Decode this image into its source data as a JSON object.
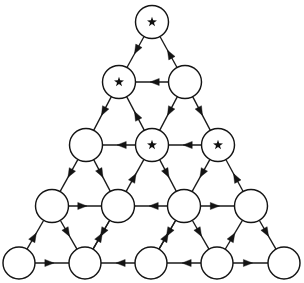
{
  "figure": {
    "background_color": "#ffffff",
    "line_color": "#141414",
    "node_fill_color": "#ffffff",
    "star_color": "#111111",
    "width": 304,
    "height": 283,
    "row_count": 5,
    "node_count": 15,
    "starred_node_count": 4,
    "marker_glyph": "star"
  },
  "nodes": [
    {
      "id": "r1c1",
      "row": 1,
      "col": 1,
      "cx": 152,
      "cy": 22,
      "r": 16.5,
      "star": true,
      "label": ""
    },
    {
      "id": "r2c1",
      "row": 2,
      "col": 1,
      "cx": 119,
      "cy": 82,
      "r": 16.5,
      "star": true,
      "label": ""
    },
    {
      "id": "r2c2",
      "row": 2,
      "col": 2,
      "cx": 185,
      "cy": 82,
      "r": 16.5,
      "star": false,
      "label": ""
    },
    {
      "id": "r3c1",
      "row": 3,
      "col": 1,
      "cx": 86,
      "cy": 145,
      "r": 16.5,
      "star": false,
      "label": ""
    },
    {
      "id": "r3c2",
      "row": 3,
      "col": 2,
      "cx": 152,
      "cy": 145,
      "r": 16.5,
      "star": true,
      "label": ""
    },
    {
      "id": "r3c3",
      "row": 3,
      "col": 3,
      "cx": 218,
      "cy": 145,
      "r": 16.5,
      "star": true,
      "label": ""
    },
    {
      "id": "r4c1",
      "row": 4,
      "col": 1,
      "cx": 52,
      "cy": 206,
      "r": 16.5,
      "star": false,
      "label": ""
    },
    {
      "id": "r4c2",
      "row": 4,
      "col": 2,
      "cx": 118,
      "cy": 206,
      "r": 16.5,
      "star": false,
      "label": ""
    },
    {
      "id": "r4c3",
      "row": 4,
      "col": 3,
      "cx": 184,
      "cy": 206,
      "r": 16.5,
      "star": false,
      "label": ""
    },
    {
      "id": "r4c4",
      "row": 4,
      "col": 4,
      "cx": 251,
      "cy": 206,
      "r": 16.5,
      "star": false,
      "label": ""
    },
    {
      "id": "r5c1",
      "row": 5,
      "col": 1,
      "cx": 19,
      "cy": 263,
      "r": 16.0,
      "star": false,
      "label": ""
    },
    {
      "id": "r5c2",
      "row": 5,
      "col": 2,
      "cx": 85,
      "cy": 263,
      "r": 16.0,
      "star": false,
      "label": ""
    },
    {
      "id": "r5c3",
      "row": 5,
      "col": 3,
      "cx": 151,
      "cy": 263,
      "r": 16.0,
      "star": false,
      "label": ""
    },
    {
      "id": "r5c4",
      "row": 5,
      "col": 4,
      "cx": 217,
      "cy": 263,
      "r": 16.0,
      "star": false,
      "label": ""
    },
    {
      "id": "r5c5",
      "row": 5,
      "col": 5,
      "cx": 284,
      "cy": 263,
      "r": 16.0,
      "star": false,
      "label": ""
    }
  ],
  "edges": [
    {
      "from": "r1c1",
      "to": "r2c1",
      "kind": "diagonal-left",
      "directed": true
    },
    {
      "from": "r2c2",
      "to": "r1c1",
      "kind": "diagonal-right",
      "directed": true
    },
    {
      "from": "r2c2",
      "to": "r2c1",
      "kind": "horizontal-left",
      "directed": true
    },
    {
      "from": "r2c1",
      "to": "r3c1",
      "kind": "diagonal-left",
      "directed": true
    },
    {
      "from": "r3c2",
      "to": "r2c1",
      "kind": "diagonal-right",
      "directed": true
    },
    {
      "from": "r2c2",
      "to": "r3c2",
      "kind": "diagonal-left",
      "directed": true
    },
    {
      "from": "r2c2",
      "to": "r3c3",
      "kind": "diagonal-right",
      "directed": true
    },
    {
      "from": "r3c2",
      "to": "r3c1",
      "kind": "horizontal-left",
      "directed": true
    },
    {
      "from": "r3c3",
      "to": "r3c2",
      "kind": "horizontal-left",
      "directed": true
    },
    {
      "from": "r3c1",
      "to": "r4c1",
      "kind": "diagonal-left",
      "directed": true
    },
    {
      "from": "r3c1",
      "to": "r4c2",
      "kind": "diagonal-right",
      "directed": true
    },
    {
      "from": "r4c2",
      "to": "r3c2",
      "kind": "diagonal-right",
      "directed": true
    },
    {
      "from": "r3c2",
      "to": "r4c3",
      "kind": "diagonal-right",
      "directed": true
    },
    {
      "from": "r3c3",
      "to": "r4c3",
      "kind": "diagonal-left",
      "directed": true
    },
    {
      "from": "r4c4",
      "to": "r3c3",
      "kind": "diagonal-right",
      "directed": true
    },
    {
      "from": "r4c1",
      "to": "r4c2",
      "kind": "horizontal-right",
      "directed": true
    },
    {
      "from": "r4c3",
      "to": "r4c2",
      "kind": "horizontal-left",
      "directed": true
    },
    {
      "from": "r4c3",
      "to": "r4c4",
      "kind": "horizontal-right",
      "directed": true
    },
    {
      "from": "r5c1",
      "to": "r4c1",
      "kind": "diagonal-right",
      "directed": true
    },
    {
      "from": "r4c1",
      "to": "r5c2",
      "kind": "diagonal-right",
      "directed": true
    },
    {
      "from": "r5c2",
      "to": "r4c2",
      "kind": "diagonal-right",
      "directed": true
    },
    {
      "from": "r4c2",
      "to": "r5c2",
      "kind": "diagonal-left",
      "directed": true
    },
    {
      "from": "r4c3",
      "to": "r5c3",
      "kind": "diagonal-left",
      "directed": true
    },
    {
      "from": "r5c3",
      "to": "r4c3",
      "kind": "diagonal-right",
      "directed": true
    },
    {
      "from": "r4c3",
      "to": "r5c4",
      "kind": "diagonal-right",
      "directed": true
    },
    {
      "from": "r5c4",
      "to": "r4c4",
      "kind": "diagonal-right",
      "directed": true
    },
    {
      "from": "r4c4",
      "to": "r5c5",
      "kind": "diagonal-right",
      "directed": true
    },
    {
      "from": "r5c1",
      "to": "r5c2",
      "kind": "horizontal-right",
      "directed": true
    },
    {
      "from": "r5c3",
      "to": "r5c2",
      "kind": "horizontal-left",
      "directed": true
    },
    {
      "from": "r5c4",
      "to": "r5c3",
      "kind": "horizontal-left",
      "directed": true
    },
    {
      "from": "r5c4",
      "to": "r5c5",
      "kind": "horizontal-right",
      "directed": true
    }
  ]
}
